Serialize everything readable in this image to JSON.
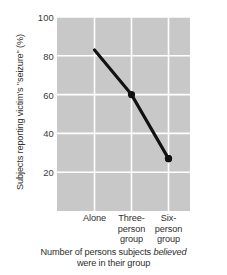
{
  "chart_data": {
    "type": "line",
    "title": "",
    "categories": [
      "Alone",
      "Three-person group",
      "Six-person group"
    ],
    "category_lines": [
      [
        "Alone"
      ],
      [
        "Three-",
        "person",
        "group"
      ],
      [
        "Six-",
        "person",
        "group"
      ]
    ],
    "values": [
      83,
      60,
      27
    ],
    "series": [
      {
        "name": "Subjects reporting victim's \"seizure\"",
        "values": [
          83,
          60,
          27
        ]
      }
    ],
    "ylabel": "Subjects reporting victim's \"seizure\" (%)",
    "xlabel_line1_pre": "Number of persons subjects ",
    "xlabel_line1_italic": "believed",
    "xlabel_line2": "were in their group",
    "xlabel": "Number of persons subjects believed were in their group",
    "yticks": [
      100,
      80,
      60,
      40,
      20
    ],
    "ytick_labels": [
      "100",
      "80",
      "60",
      "40",
      "20"
    ],
    "ylim": [
      0,
      100
    ],
    "grid": true,
    "grid_color": "#ffffff",
    "plot_background": "#c8c8c8",
    "line_color": "#111111",
    "marker_color": "#111111",
    "marker": "circle",
    "legend": "none"
  }
}
